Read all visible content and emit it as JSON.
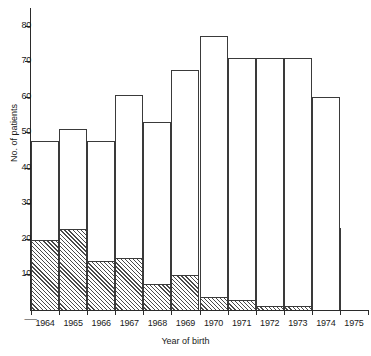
{
  "chart_data": {
    "type": "bar",
    "title": "",
    "subtitle": "",
    "xlabel": "Year of birth",
    "ylabel": "No. of patients",
    "categories": [
      "1964",
      "1965",
      "1966",
      "1967",
      "1968",
      "1969",
      "1970",
      "1971",
      "1972",
      "1973",
      "1974",
      "1975"
    ],
    "ylim": [
      0,
      85
    ],
    "y_ticks": [
      10,
      20,
      30,
      40,
      50,
      60,
      70,
      80
    ],
    "y_tick_labels": [
      "10",
      "20",
      "30",
      "40",
      "50",
      "60",
      "70",
      "80"
    ],
    "grid": false,
    "legend": "none",
    "stacked": true,
    "series": [
      {
        "name": "hatched-lower-segment",
        "fill": "diagonal-hatch",
        "values": [
          20,
          23,
          14,
          15,
          7.5,
          10,
          4,
          3,
          1.5,
          1.5,
          0,
          0
        ]
      },
      {
        "name": "open-upper-segment",
        "fill": "white",
        "values": [
          27.5,
          28,
          33.5,
          45.5,
          45.5,
          57.5,
          73,
          68,
          69.5,
          69.5,
          60,
          0
        ]
      }
    ],
    "totals": [
      47.5,
      51,
      47.5,
      60.5,
      53,
      67.5,
      77,
      71,
      71,
      71,
      60,
      23
    ],
    "incomplete_category": "1975",
    "incomplete_value": 23,
    "colors": {
      "axis": "#2b2b2b",
      "bar_outline": "#3a3a3a",
      "bar_fill": "#ffffff",
      "hatch": "#4a4a4a",
      "background": "#ffffff"
    }
  },
  "axis_break_marker": "⸺"
}
